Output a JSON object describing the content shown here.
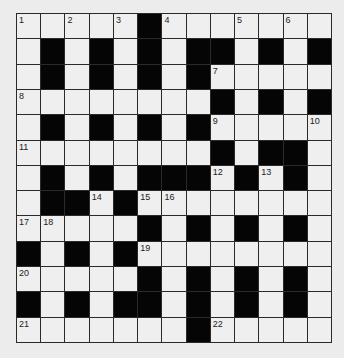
{
  "puzzle": {
    "type": "crossword",
    "rows": 13,
    "cols": 13,
    "colors": {
      "black": "#050505",
      "white": "#efefef",
      "lines": "#2a2a2a",
      "background": "#ececec"
    },
    "layout": [
      "WWWWWBWWWWWWW",
      "WBWBWBWBBWBWB",
      "WBWBWBWBWWWWW",
      "WWWWWWWWBWBWB",
      "WBWBWBWBWWWWW",
      "WWWWWWWWBWBBW",
      "WBWBWBBBWBWBW",
      "WBBWBWWWWWWWW",
      "WWWWWBWBWBWBW",
      "BWBWBWWWWWWWW",
      "WWWWWBWBWBWBW",
      "BWBWBBWBWBWBW",
      "WWWWWWWBWWWWW"
    ],
    "numbers": [
      {
        "r": 0,
        "c": 0,
        "n": "1"
      },
      {
        "r": 0,
        "c": 2,
        "n": "2"
      },
      {
        "r": 0,
        "c": 4,
        "n": "3"
      },
      {
        "r": 0,
        "c": 6,
        "n": "4"
      },
      {
        "r": 0,
        "c": 9,
        "n": "5"
      },
      {
        "r": 0,
        "c": 11,
        "n": "6"
      },
      {
        "r": 2,
        "c": 8,
        "n": "7"
      },
      {
        "r": 3,
        "c": 0,
        "n": "8"
      },
      {
        "r": 4,
        "c": 8,
        "n": "9"
      },
      {
        "r": 4,
        "c": 12,
        "n": "10"
      },
      {
        "r": 5,
        "c": 0,
        "n": "11"
      },
      {
        "r": 6,
        "c": 8,
        "n": "12"
      },
      {
        "r": 6,
        "c": 10,
        "n": "13"
      },
      {
        "r": 7,
        "c": 3,
        "n": "14"
      },
      {
        "r": 7,
        "c": 5,
        "n": "15"
      },
      {
        "r": 7,
        "c": 6,
        "n": "16"
      },
      {
        "r": 8,
        "c": 0,
        "n": "17"
      },
      {
        "r": 8,
        "c": 1,
        "n": "18"
      },
      {
        "r": 9,
        "c": 5,
        "n": "19"
      },
      {
        "r": 10,
        "c": 0,
        "n": "20"
      },
      {
        "r": 12,
        "c": 0,
        "n": "21"
      },
      {
        "r": 12,
        "c": 8,
        "n": "22"
      }
    ]
  }
}
